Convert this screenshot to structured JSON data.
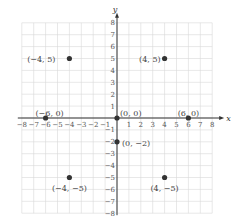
{
  "diagram": {
    "type": "coordinate-plane",
    "axes": {
      "x_label": "x",
      "y_label": "y",
      "min": -8,
      "max": 8
    },
    "x_ticks": [
      "-8",
      "-7",
      "-6",
      "-5",
      "-4",
      "-3",
      "-2",
      "-1",
      "1",
      "2",
      "3",
      "4",
      "5",
      "6",
      "7",
      "8"
    ],
    "y_ticks": [
      "-8",
      "-7",
      "-6",
      "-5",
      "-4",
      "-3",
      "-2",
      "-1",
      "1",
      "2",
      "3",
      "4",
      "5",
      "6",
      "7",
      "8"
    ],
    "points": [
      {
        "x": -4,
        "y": 5,
        "label": "(−4, 5)"
      },
      {
        "x": 4,
        "y": 5,
        "label": "(4, 5)"
      },
      {
        "x": -6,
        "y": 0,
        "label": "(−6, 0)"
      },
      {
        "x": 0,
        "y": 0,
        "label": "(0, 0)"
      },
      {
        "x": 6,
        "y": 0,
        "label": "(6, 0)"
      },
      {
        "x": 0,
        "y": -2,
        "label": "(0, −2)"
      },
      {
        "x": -4,
        "y": -5,
        "label": "(−4, −5)"
      },
      {
        "x": 4,
        "y": -5,
        "label": "(4, −5)"
      }
    ],
    "colors": {
      "grid": "#d8d8d8",
      "axis": "#333333",
      "point": "#333333"
    }
  }
}
